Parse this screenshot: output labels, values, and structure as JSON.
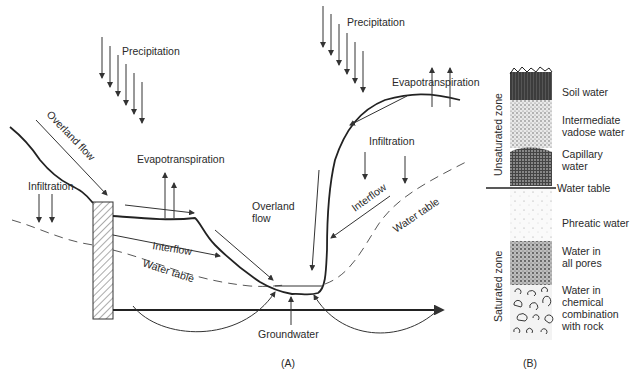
{
  "panel_a": {
    "caption": "(A)",
    "labels": {
      "precipitation_left": "Precipitation",
      "precipitation_right": "Precipitation",
      "overland_flow_left": "Overland flow",
      "overland_flow_center_line1": "Overland",
      "overland_flow_center_line2": "flow",
      "evapotranspiration_left": "Evapotranspiration",
      "evapotranspiration_right": "Evapotranspiration",
      "infiltration_left": "Infiltration",
      "infiltration_right": "Infiltration",
      "interflow_left": "Interflow",
      "interflow_right": "Interflow",
      "water_table_left": "Water table",
      "water_table_right": "Water table",
      "groundwater": "Groundwater"
    }
  },
  "panel_b": {
    "caption": "(B)",
    "zones": {
      "unsaturated": "Unsaturated zone",
      "saturated": "Saturated zone"
    },
    "water_table": "Water table",
    "layers": [
      {
        "line1": "Soil water",
        "line2": ""
      },
      {
        "line1": "Intermediate",
        "line2": "vadose water"
      },
      {
        "line1": "Capillary",
        "line2": "water"
      },
      {
        "line1": "Phreatic water",
        "line2": ""
      },
      {
        "line1": "Water in",
        "line2": "all pores"
      },
      {
        "line1": "Water in",
        "line2": "chemical",
        "line3": "combination",
        "line4": "with rock"
      }
    ]
  }
}
